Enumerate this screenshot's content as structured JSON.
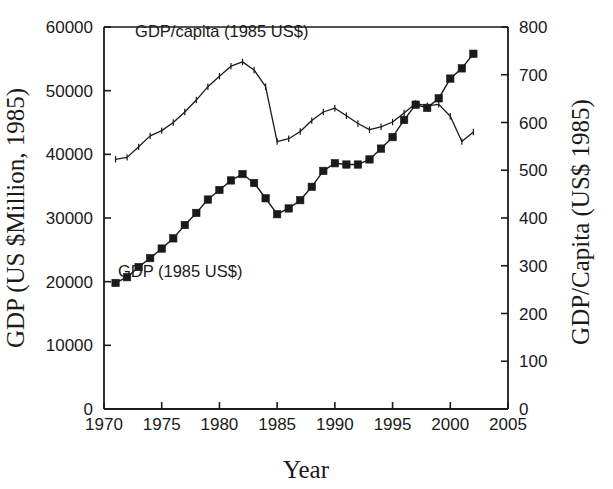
{
  "figure": {
    "background_color": "#ffffff",
    "ink_color": "#1a1a1a"
  },
  "chart_data": {
    "type": "line",
    "title": "",
    "subtitle": "",
    "xlabel": "Year",
    "ylabel": "GDP (US $Million, 1985)",
    "y2label": "GDP/Capita (US$ 1985)",
    "xlim": [
      1970,
      2005
    ],
    "ylim": [
      0,
      60000
    ],
    "y2lim": [
      0,
      800
    ],
    "xticks": [
      1970,
      1975,
      1980,
      1985,
      1990,
      1995,
      2000,
      2005
    ],
    "xtick_labels": [
      "1970",
      "1975",
      "1980",
      "1985",
      "1990",
      "1995",
      "2000",
      "2005"
    ],
    "yticks": [
      0,
      10000,
      20000,
      30000,
      40000,
      50000,
      60000
    ],
    "ytick_labels": [
      "0",
      "10000",
      "20000",
      "30000",
      "40000",
      "50000",
      "60000"
    ],
    "y2ticks": [
      0,
      100,
      200,
      300,
      400,
      500,
      600,
      700,
      800
    ],
    "y2tick_labels": [
      "0",
      "100",
      "200",
      "300",
      "400",
      "500",
      "600",
      "700",
      "800"
    ],
    "grid": false,
    "legend_position": "inline-annotations",
    "annotations": [
      {
        "text": "GDP/capita (1985 US$)",
        "x": 1980.2,
        "y2": 780,
        "series": "gdp_per_capita"
      },
      {
        "text": "GDP (1985 US$)",
        "x": 1976.6,
        "y": 20700,
        "series": "gdp"
      }
    ],
    "x": [
      1971,
      1972,
      1973,
      1974,
      1975,
      1976,
      1977,
      1978,
      1979,
      1980,
      1981,
      1982,
      1983,
      1984,
      1985,
      1986,
      1987,
      1988,
      1989,
      1990,
      1991,
      1992,
      1993,
      1994,
      1995,
      1996,
      1997,
      1998,
      1999,
      2000,
      2001,
      2002
    ],
    "series": [
      {
        "name": "GDP (1985 US$)",
        "axis": "left",
        "units": "US $Million, 1985",
        "marker": "filled-square",
        "values": [
          19800,
          20700,
          22300,
          23700,
          25200,
          26800,
          28900,
          30800,
          32900,
          34400,
          35900,
          36900,
          35500,
          33100,
          30600,
          31500,
          32800,
          34900,
          37400,
          38600,
          38400,
          38400,
          39200,
          40900,
          42700,
          45400,
          47800,
          47300,
          48800,
          51900,
          53500,
          55800
        ]
      },
      {
        "name": "GDP/capita (1985 US$)",
        "axis": "right",
        "units": "US$ 1985",
        "marker": "tick",
        "values": [
          523,
          527,
          549,
          572,
          583,
          600,
          622,
          647,
          675,
          697,
          718,
          727,
          710,
          675,
          560,
          566,
          581,
          604,
          622,
          630,
          614,
          598,
          585,
          591,
          601,
          620,
          640,
          635,
          638,
          613,
          560,
          580
        ]
      }
    ]
  }
}
